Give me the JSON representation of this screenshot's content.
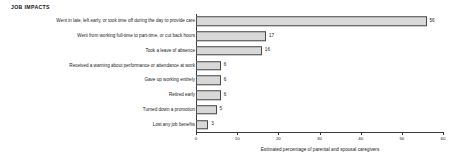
{
  "chart_data": {
    "type": "bar",
    "orientation": "horizontal",
    "title": "JOB IMPACTS",
    "xlabel": "Estimated percentage of parental and spousal caregivers",
    "ylabel": "",
    "xlim": [
      0,
      60
    ],
    "xticks": [
      0,
      10,
      20,
      30,
      40,
      50,
      60
    ],
    "xtick_labels": [
      "0",
      "10",
      "20",
      "30",
      "40",
      "50",
      "60"
    ],
    "grid": false,
    "legend": null,
    "bar_fill_color": "#d8d8d8",
    "bar_border_color": "#4a4a4a",
    "categories": [
      "Went in late, left early, or took time off during the day to provide care",
      "Went from working full-time to part-time, or cut back hours",
      "Took a leave of absence",
      "Received a warning about performance or attendance at work",
      "Gave up working entirely",
      "Retired early",
      "Turned down a promotion",
      "Lost any job benefits"
    ],
    "values": [
      56,
      17,
      16,
      6,
      6,
      6,
      5,
      3
    ],
    "value_labels": [
      "56",
      "17",
      "16",
      "6",
      "6",
      "6",
      "5",
      "3"
    ]
  }
}
